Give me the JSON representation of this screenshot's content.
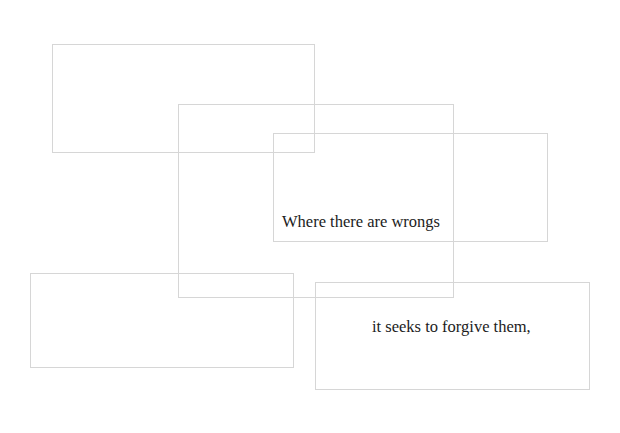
{
  "canvas": {
    "width": 620,
    "height": 433,
    "background": "#ffffff",
    "border_color": "#d6d6d6"
  },
  "boxes": [
    {
      "id": "box-1",
      "x": 52,
      "y": 44,
      "w": 263,
      "h": 109
    },
    {
      "id": "box-2",
      "x": 178,
      "y": 104,
      "w": 276,
      "h": 194
    },
    {
      "id": "box-3",
      "x": 273,
      "y": 133,
      "w": 275,
      "h": 109
    },
    {
      "id": "box-4",
      "x": 30,
      "y": 273,
      "w": 264,
      "h": 95
    },
    {
      "id": "box-5",
      "x": 315,
      "y": 282,
      "w": 275,
      "h": 108
    }
  ],
  "texts": {
    "line1": "Where there are wrongs",
    "line2": "it seeks to forgive them,"
  }
}
